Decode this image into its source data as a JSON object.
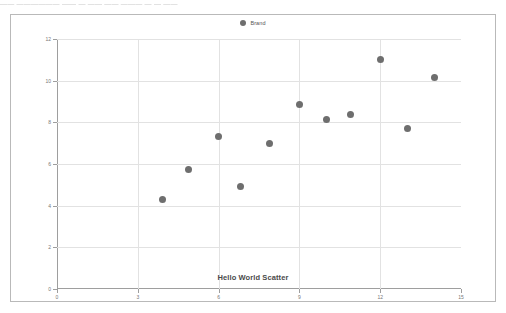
{
  "top_strip_text": "—— —————— —— — —— —— ——— —  — ——",
  "legend": {
    "entries": [
      {
        "label": "Brand",
        "color": "#6e6e6e",
        "marker": "circle"
      }
    ],
    "position": "top-center"
  },
  "chart_data": {
    "type": "scatter",
    "title": "",
    "subtitle": "",
    "xlabel": "Hello World Scatter",
    "ylabel": "",
    "xlim": [
      0,
      15
    ],
    "ylim": [
      0,
      12
    ],
    "xticks": [
      0,
      3,
      6,
      9,
      12,
      15
    ],
    "yticks": [
      0,
      2,
      4,
      6,
      8,
      10,
      12
    ],
    "grid": true,
    "marker_color": "#6e6e6e",
    "marker_size": 7,
    "series": [
      {
        "name": "Brand",
        "color": "#6e6e6e",
        "points": [
          {
            "x": 3.9,
            "y": 4.3
          },
          {
            "x": 4.9,
            "y": 5.75
          },
          {
            "x": 6.0,
            "y": 7.3
          },
          {
            "x": 6.8,
            "y": 4.9
          },
          {
            "x": 7.9,
            "y": 7.0
          },
          {
            "x": 9.0,
            "y": 8.85
          },
          {
            "x": 10.0,
            "y": 8.15
          },
          {
            "x": 10.9,
            "y": 8.4
          },
          {
            "x": 12.0,
            "y": 11.0
          },
          {
            "x": 13.0,
            "y": 7.7
          },
          {
            "x": 14.0,
            "y": 10.15
          }
        ]
      }
    ]
  },
  "axis": {
    "x_title": "Hello World Scatter",
    "x_tick_labels": [
      "0",
      "3",
      "6",
      "9",
      "12",
      "15"
    ],
    "y_tick_labels": [
      "0",
      "2",
      "4",
      "6",
      "8",
      "10",
      "12"
    ]
  },
  "colors": {
    "marker": "#6e6e6e",
    "gridline": "#e2e2e2",
    "axis": "#9e9e9e",
    "frame": "#b9b9b9",
    "tick_text": "#777777",
    "title_text": "#4a4a4a"
  }
}
